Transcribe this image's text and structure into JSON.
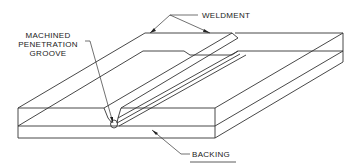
{
  "figure": {
    "type": "isometric technical drawing",
    "labels": {
      "weldment": "WELDMENT",
      "groove": [
        "MACHINED",
        "PENETRATION",
        "GROOVE"
      ],
      "backing": "BACKING"
    },
    "colors": {
      "line": "#333333",
      "text": "#222222",
      "background": "#ffffff"
    }
  }
}
